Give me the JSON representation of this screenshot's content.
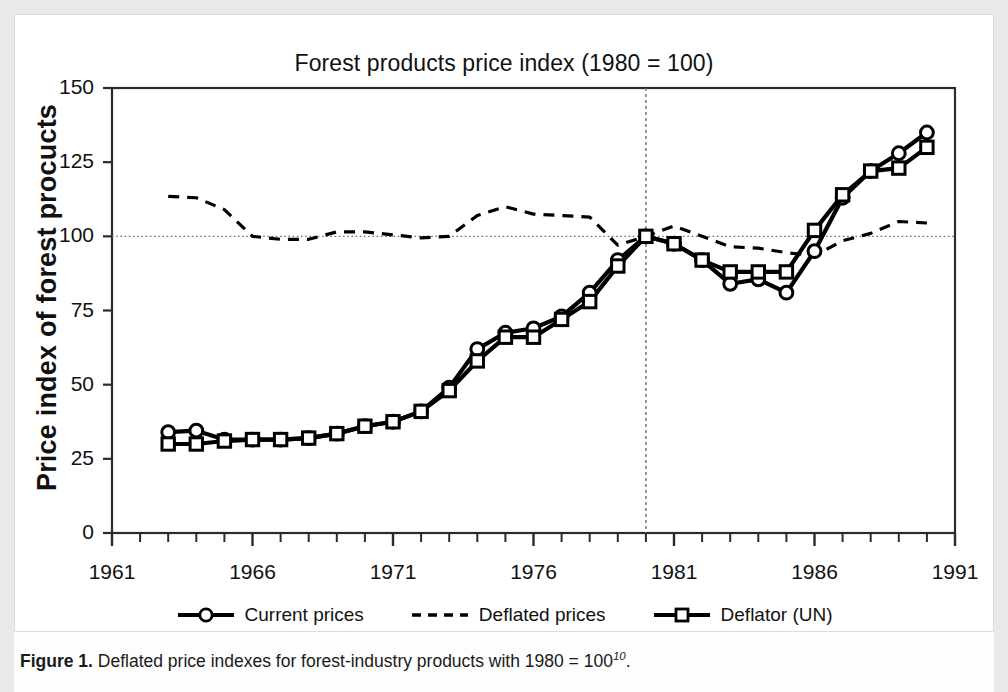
{
  "figure": {
    "caption_label": "Figure 1.",
    "caption_text": "Deflated price indexes for forest-industry products with 1980 = 100",
    "caption_superscript": "10",
    "caption_end": "."
  },
  "chart_data": {
    "type": "line",
    "title": "Forest products price index (1980 = 100)",
    "xlabel": "",
    "ylabel": "Price index of forest procucts",
    "xlim": [
      1961,
      1991
    ],
    "ylim": [
      0,
      150
    ],
    "yticks": [
      0,
      25,
      50,
      75,
      100,
      125,
      150
    ],
    "xticks": [
      1961,
      1966,
      1971,
      1976,
      1981,
      1986,
      1991
    ],
    "xtick_minor_step": 1,
    "grid": false,
    "reference_lines": {
      "horizontal_value": 100,
      "vertical_value": 1980,
      "style": "dotted"
    },
    "legend_position": "below",
    "x": [
      1963,
      1964,
      1965,
      1966,
      1967,
      1968,
      1969,
      1970,
      1971,
      1972,
      1973,
      1974,
      1975,
      1976,
      1977,
      1978,
      1979,
      1980,
      1981,
      1982,
      1983,
      1984,
      1985,
      1986,
      1987,
      1988,
      1989,
      1990
    ],
    "series": [
      {
        "name": "Current prices",
        "marker": "circle",
        "linestyle": "solid",
        "values": [
          34,
          34.5,
          31.5,
          31.5,
          31.5,
          32,
          33.5,
          36,
          37.5,
          41,
          49,
          62,
          67.5,
          69,
          73,
          81,
          92,
          100,
          97.5,
          92,
          84,
          85.5,
          81,
          95,
          113,
          122,
          128,
          135
        ]
      },
      {
        "name": "Deflated prices",
        "marker": "none",
        "linestyle": "dashed",
        "values": [
          113.5,
          113,
          109,
          100,
          99,
          99,
          101.5,
          101.5,
          100.5,
          99.5,
          100,
          107,
          110,
          107.5,
          107,
          106.5,
          97,
          100,
          103.5,
          100,
          96.5,
          96,
          94.5,
          93.5,
          98.5,
          101,
          105,
          104.5
        ]
      },
      {
        "name": "Deflator (UN)",
        "marker": "square",
        "linestyle": "solid",
        "values": [
          30,
          30,
          31,
          31.5,
          31.5,
          32,
          33.5,
          36,
          37.5,
          41,
          48,
          58,
          66,
          66,
          72,
          78,
          90,
          100,
          97.5,
          92,
          88,
          88,
          88,
          102,
          114,
          122,
          123,
          130
        ]
      }
    ]
  }
}
